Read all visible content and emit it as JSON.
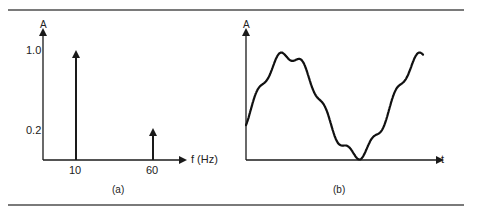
{
  "figure": {
    "panel_a": {
      "caption": "(a)",
      "y_axis_label": "A",
      "x_axis_label": "f (Hz)",
      "y_ticks": [
        "1.0",
        "0.2"
      ],
      "x_ticks": [
        "10",
        "60"
      ]
    },
    "panel_b": {
      "caption": "(b)",
      "y_axis_label": "A",
      "x_axis_label": "t"
    }
  },
  "chart_data": [
    {
      "type": "bar",
      "title": "Amplitude spectrum",
      "xlabel": "f (Hz)",
      "ylabel": "A",
      "categories": [
        "10",
        "60"
      ],
      "values": [
        1.0,
        0.2
      ],
      "style": "spectral lines with arrowheads",
      "grid": false
    },
    {
      "type": "line",
      "title": "Time-domain signal",
      "xlabel": "t",
      "ylabel": "A",
      "description": "Sum of a 10 Hz sinusoid (amplitude 1.0) and a 60 Hz sinusoid (amplitude 0.2)",
      "grid": false
    }
  ]
}
